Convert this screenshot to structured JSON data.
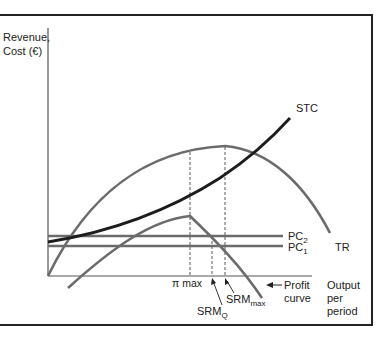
{
  "figure": {
    "y_axis_label_line1": "Revenue,",
    "y_axis_label_line2": "Cost (€)",
    "x_axis_label_line1": "Output",
    "x_axis_label_line2": "per",
    "x_axis_label_line3": "period"
  },
  "curves": {
    "stc": {
      "label": "STC",
      "color": "#1c1c1c"
    },
    "tr": {
      "label": "TR",
      "color": "#6b6b6b"
    },
    "pc2": {
      "label_main": "PC",
      "label_sub": "2",
      "color": "#6b6b6b"
    },
    "pc1": {
      "label_main": "PC",
      "label_sub": "1",
      "color": "#6b6b6b"
    },
    "profit": {
      "label_line1": "Profit",
      "label_line2": "curve",
      "color": "#6b6b6b"
    }
  },
  "markers": {
    "pi_max": {
      "label": "π max"
    },
    "srm_q": {
      "label_main": "SRM",
      "label_sub": "Q"
    },
    "srm_max": {
      "label_main": "SRM",
      "label_sub": "max"
    }
  },
  "colors": {
    "frame": "#222222",
    "axis": "#555555",
    "dashed": "#444444"
  }
}
